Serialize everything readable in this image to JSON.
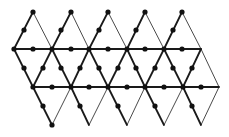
{
  "diagram": {
    "title": "",
    "colors": {
      "line": "#1a1a1a",
      "dot": "#111111",
      "background": "#ffffff"
    },
    "rows": {
      "top_apex_y": 12,
      "row1_y": 49,
      "row2_y": 87,
      "bottom_y": 125,
      "top_apex_x": [
        33,
        71,
        108,
        145,
        182
      ],
      "row1_x": [
        14,
        52,
        89,
        127,
        164,
        201
      ],
      "row2_x": [
        33,
        71,
        108,
        145,
        183,
        219
      ],
      "bottom_x": [
        52,
        89,
        127,
        164,
        201
      ]
    },
    "thick_edges": [
      [
        33,
        12,
        14,
        49
      ],
      [
        71,
        12,
        52,
        49
      ],
      [
        108,
        12,
        89,
        49
      ],
      [
        145,
        12,
        127,
        49
      ],
      [
        182,
        12,
        164,
        49
      ],
      [
        14,
        49,
        201,
        49
      ],
      [
        14,
        49,
        33,
        87
      ],
      [
        52,
        49,
        33,
        87
      ],
      [
        52,
        49,
        71,
        87
      ],
      [
        89,
        49,
        71,
        87
      ],
      [
        89,
        49,
        108,
        87
      ],
      [
        127,
        49,
        108,
        87
      ],
      [
        127,
        49,
        145,
        87
      ],
      [
        164,
        49,
        145,
        87
      ],
      [
        164,
        49,
        183,
        87
      ],
      [
        201,
        49,
        183,
        87
      ],
      [
        33,
        87,
        219,
        87
      ],
      [
        33,
        87,
        52,
        125
      ],
      [
        71,
        87,
        89,
        125
      ],
      [
        108,
        87,
        127,
        125
      ],
      [
        145,
        87,
        164,
        125
      ],
      [
        183,
        87,
        201,
        125
      ]
    ],
    "thin_edges": [
      [
        33,
        12,
        52,
        49
      ],
      [
        71,
        12,
        89,
        49
      ],
      [
        108,
        12,
        127,
        49
      ],
      [
        145,
        12,
        164,
        49
      ],
      [
        182,
        12,
        201,
        49
      ],
      [
        201,
        49,
        219,
        87
      ],
      [
        52,
        125,
        71,
        87
      ],
      [
        89,
        125,
        108,
        87
      ],
      [
        127,
        125,
        145,
        87
      ],
      [
        164,
        125,
        183,
        87
      ],
      [
        201,
        125,
        219,
        87
      ]
    ],
    "dots": [
      [
        33,
        12
      ],
      [
        71,
        12
      ],
      [
        108,
        12
      ],
      [
        145,
        12
      ],
      [
        182,
        12
      ],
      [
        24,
        30
      ],
      [
        61,
        30
      ],
      [
        99,
        30
      ],
      [
        136,
        30
      ],
      [
        173,
        30
      ],
      [
        14,
        49
      ],
      [
        33,
        49
      ],
      [
        52,
        49
      ],
      [
        71,
        49
      ],
      [
        89,
        49
      ],
      [
        108,
        49
      ],
      [
        127,
        49
      ],
      [
        145,
        49
      ],
      [
        164,
        49
      ],
      [
        182,
        49
      ],
      [
        24,
        68
      ],
      [
        43,
        68
      ],
      [
        61,
        68
      ],
      [
        80,
        68
      ],
      [
        99,
        68
      ],
      [
        118,
        68
      ],
      [
        136,
        68
      ],
      [
        155,
        68
      ],
      [
        173,
        68
      ],
      [
        192,
        68
      ],
      [
        33,
        87
      ],
      [
        52,
        87
      ],
      [
        71,
        87
      ],
      [
        89,
        87
      ],
      [
        108,
        87
      ],
      [
        127,
        87
      ],
      [
        145,
        87
      ],
      [
        164,
        87
      ],
      [
        183,
        87
      ],
      [
        201,
        87
      ],
      [
        43,
        106
      ],
      [
        80,
        106
      ],
      [
        118,
        106
      ],
      [
        155,
        106
      ],
      [
        192,
        106
      ],
      [
        52,
        125
      ]
    ],
    "dot_radius": 2.6
  }
}
